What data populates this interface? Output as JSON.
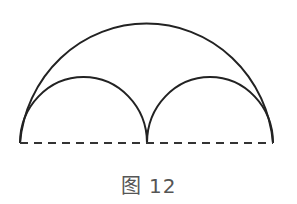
{
  "figure": {
    "caption": "图 12",
    "stroke_color": "#222222",
    "shapes": [
      {
        "name": "large-semicircle",
        "type": "arc"
      },
      {
        "name": "left-small-semicircle",
        "type": "arc"
      },
      {
        "name": "right-small-semicircle",
        "type": "arc"
      },
      {
        "name": "diameter",
        "type": "dashed-line"
      }
    ]
  }
}
